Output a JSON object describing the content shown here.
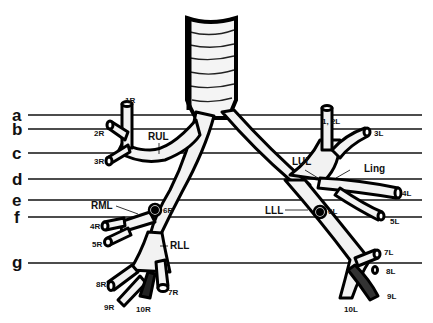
{
  "diagram": {
    "corner_fragment": "...",
    "levels": [
      {
        "label": "a",
        "y": 115
      },
      {
        "label": "b",
        "y": 129
      },
      {
        "label": "c",
        "y": 153
      },
      {
        "label": "d",
        "y": 179
      },
      {
        "label": "e",
        "y": 200
      },
      {
        "label": "f",
        "y": 217
      },
      {
        "label": "g",
        "y": 263
      }
    ],
    "lobes": {
      "rul": "RUL",
      "rml": "RML",
      "rll": "RLL",
      "lul": "LUL",
      "ling": "Ling",
      "lll": "LLL"
    },
    "segments_right": {
      "s1": "1R",
      "s2": "2R",
      "s3": "3R",
      "s4": "4R",
      "s5": "5R",
      "s6": "6R",
      "s7": "7R",
      "s8": "8R",
      "s9": "9R",
      "s10": "10R"
    },
    "segments_left": {
      "s12": "1, 2L",
      "s3": "3L",
      "s4": "4L",
      "s5": "5L",
      "s6": "6L",
      "s7": "7L",
      "s8": "8L",
      "s9": "9L",
      "s10": "10L"
    }
  }
}
